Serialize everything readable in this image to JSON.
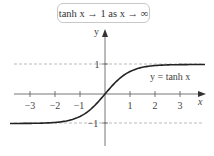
{
  "chart_data": {
    "type": "line",
    "title": "tanh x → 1 as x → ∞",
    "xlabel": "x",
    "ylabel": "y",
    "xlim": [
      -3.8,
      4
    ],
    "ylim": [
      -1.4,
      1.3
    ],
    "x_ticks": [
      -3,
      -2,
      -1,
      1,
      2,
      3
    ],
    "x_tick_labels": [
      "−3",
      "−2",
      "−1",
      "1",
      "2",
      "3"
    ],
    "y_ticks": [
      1,
      -1
    ],
    "y_tick_labels": [
      "1",
      "−1"
    ],
    "series": [
      {
        "name": "y = tanh x",
        "function": "tanh",
        "x": [
          -3.8,
          -3,
          -2,
          -1,
          0,
          1,
          2,
          3,
          4
        ],
        "values": [
          -0.999,
          -0.995,
          -0.964,
          -0.762,
          0,
          0.762,
          0.964,
          0.995,
          0.999
        ]
      }
    ],
    "asymptotes": [
      {
        "y": 1,
        "style": "dashed"
      },
      {
        "y": -1,
        "style": "dashed"
      }
    ],
    "annotations": [
      {
        "text": "y = tanh x",
        "x": 2.5,
        "y": 0.8
      }
    ],
    "grid": false,
    "legend": "none"
  },
  "title": "tanh x → 1 as x → ∞",
  "axes": {
    "x_label": "x",
    "y_label": "y"
  },
  "curve_label": "y = tanh x",
  "ticks": {
    "x": [
      "−3",
      "−2",
      "−1",
      "1",
      "2",
      "3"
    ],
    "y_pos": "1",
    "y_neg": "−1"
  },
  "colors": {
    "axis": "#777777",
    "curve": "#222222",
    "dashed": "#aaaaaa"
  }
}
